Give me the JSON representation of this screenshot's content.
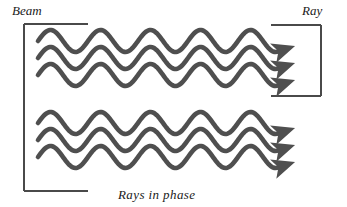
{
  "figure": {
    "title_left": "Beam",
    "title_right": "Ray",
    "caption": "Rays in phase",
    "colors": {
      "wave": "#4f4f4f",
      "bracket": "#4a4a4a",
      "text": "#1a1a1a",
      "background": "#ffffff"
    },
    "brackets": {
      "left": {
        "orientation": "opens-right",
        "x": 24,
        "y_top": 24,
        "y_bottom": 191,
        "arm_length": 64
      },
      "right": {
        "orientation": "opens-left",
        "x": 321,
        "y_top": 25,
        "y_bottom": 96,
        "arm_length": 50
      }
    },
    "wave_params": {
      "count": 6,
      "groups": 2,
      "waves_per_group": 3,
      "amplitude": 11,
      "wavelength": 50,
      "x_start": 38,
      "x_end": 278,
      "stroke_width": 4.6,
      "baselines": [
        41,
        58,
        75,
        123,
        140,
        157
      ],
      "phase_degrees": 0,
      "arrowhead": "down-right-filled"
    }
  }
}
